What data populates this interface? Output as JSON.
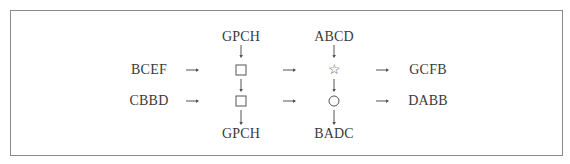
{
  "diagram": {
    "inputs": {
      "top": "BCEF",
      "bottom": "CBBD"
    },
    "column1": {
      "top_label": "GPCH",
      "bottom_label": "GPCH",
      "node_top": "square",
      "node_bottom": "square"
    },
    "column2": {
      "top_label": "ABCD",
      "bottom_label": "BADC",
      "node_top": "star",
      "node_bottom": "circle"
    },
    "outputs": {
      "top": "GCFB",
      "bottom": "DABB"
    },
    "symbols": {
      "star": "☆"
    }
  }
}
